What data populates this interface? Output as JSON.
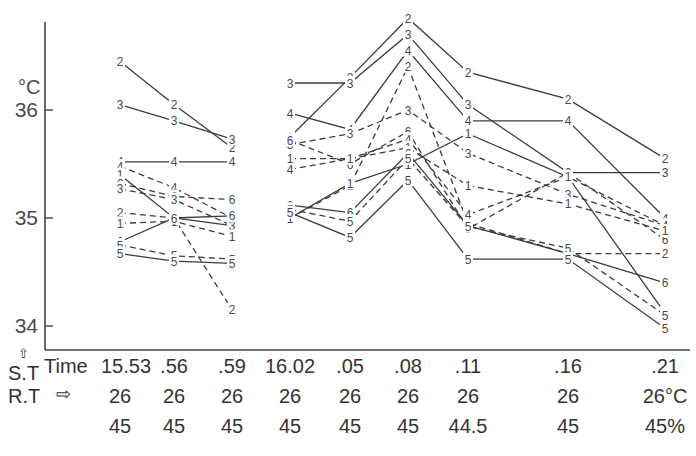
{
  "chart_data": {
    "type": "line",
    "title": "",
    "ylabel_unit": "°C",
    "ylim": [
      33.9,
      36.8
    ],
    "yticks": [
      34,
      35,
      36
    ],
    "x_labels": [
      "15.53",
      ".56",
      ".59",
      "16.02",
      ".05",
      ".08",
      ".11",
      ".16",
      ".21"
    ],
    "x_label_prefix": "Time",
    "row_labels": {
      "skin_temp": "S.T",
      "room_temp": "R.T",
      "arrow_up": "⇧",
      "arrow_right": "⇨"
    },
    "room_temp": [
      "26",
      "26",
      "26",
      "26",
      "26",
      "26",
      "26",
      "26",
      "26°C"
    ],
    "humidity": [
      "45",
      "45",
      "45",
      "45",
      "45",
      "45",
      "44.5",
      "45",
      "45%"
    ],
    "segments": [
      {
        "group": "A",
        "label": "2",
        "style": "solid",
        "points": [
          [
            0,
            36.45
          ],
          [
            1,
            36.05
          ],
          [
            2,
            35.65
          ]
        ]
      },
      {
        "group": "A",
        "label": "3",
        "style": "solid",
        "points": [
          [
            0,
            36.05
          ],
          [
            1,
            35.9
          ],
          [
            2,
            35.73
          ]
        ]
      },
      {
        "group": "A",
        "label": "4",
        "style": "solid",
        "points": [
          [
            0,
            35.52
          ],
          [
            1,
            35.52
          ],
          [
            2,
            35.52
          ]
        ]
      },
      {
        "group": "A",
        "label": "4",
        "style": "dashed",
        "points": [
          [
            0,
            35.48
          ],
          [
            1,
            35.28
          ],
          [
            2,
            35.0
          ]
        ]
      },
      {
        "group": "A",
        "label": "1",
        "style": "solid",
        "points": [
          [
            0,
            35.4
          ],
          [
            1,
            35.0
          ],
          [
            2,
            34.93
          ]
        ]
      },
      {
        "group": "A",
        "label": "6",
        "style": "dashed",
        "points": [
          [
            0,
            35.32
          ],
          [
            1,
            35.2
          ],
          [
            2,
            35.17
          ]
        ]
      },
      {
        "group": "A",
        "label": "3",
        "style": "dashed",
        "points": [
          [
            0,
            35.27
          ],
          [
            1,
            35.17
          ],
          [
            2,
            34.93
          ]
        ]
      },
      {
        "group": "A",
        "label": "2",
        "style": "dashed",
        "points": [
          [
            0,
            35.05
          ],
          [
            1,
            35.0
          ],
          [
            2,
            34.15
          ]
        ]
      },
      {
        "group": "A",
        "label": "1",
        "style": "dashed",
        "points": [
          [
            0,
            34.95
          ],
          [
            1,
            34.97
          ],
          [
            2,
            34.83
          ]
        ]
      },
      {
        "group": "A",
        "label": "6",
        "style": "solid",
        "points": [
          [
            0,
            34.78
          ],
          [
            1,
            35.0
          ],
          [
            2,
            35.02
          ]
        ]
      },
      {
        "group": "A",
        "label": "5",
        "style": "dashed",
        "points": [
          [
            0,
            34.75
          ],
          [
            1,
            34.65
          ],
          [
            2,
            34.62
          ]
        ]
      },
      {
        "group": "A",
        "label": "5",
        "style": "solid",
        "points": [
          [
            0,
            34.67
          ],
          [
            1,
            34.6
          ],
          [
            2,
            34.58
          ]
        ]
      },
      {
        "group": "B",
        "label": "2",
        "style": "solid",
        "points": [
          [
            3,
            35.75
          ],
          [
            4,
            36.3
          ],
          [
            5,
            36.85
          ],
          [
            6,
            36.35
          ],
          [
            7,
            36.1
          ],
          [
            8,
            35.55
          ]
        ]
      },
      {
        "group": "B",
        "label": "3",
        "style": "solid",
        "points": [
          [
            3,
            36.25
          ],
          [
            4,
            36.25
          ],
          [
            5,
            36.7
          ],
          [
            6,
            36.05
          ],
          [
            7,
            35.42
          ],
          [
            8,
            35.42
          ]
        ]
      },
      {
        "group": "B",
        "label": "4",
        "style": "solid",
        "points": [
          [
            3,
            35.97
          ],
          [
            4,
            35.82
          ],
          [
            5,
            36.55
          ],
          [
            6,
            35.9
          ],
          [
            7,
            35.9
          ],
          [
            8,
            35.0
          ]
        ]
      },
      {
        "group": "B",
        "label": "3",
        "style": "dashed",
        "points": [
          [
            3,
            35.68
          ],
          [
            4,
            35.78
          ],
          [
            5,
            36.0
          ],
          [
            6,
            35.6
          ],
          [
            7,
            35.22
          ],
          [
            8,
            34.93
          ]
        ]
      },
      {
        "group": "B",
        "label": "2",
        "style": "dashed",
        "points": [
          [
            3,
            35.0
          ],
          [
            4,
            35.3
          ],
          [
            5,
            36.4
          ],
          [
            6,
            34.95
          ],
          [
            7,
            34.67
          ],
          [
            8,
            34.67
          ]
        ]
      },
      {
        "group": "B",
        "label": "6",
        "style": "dashed",
        "points": [
          [
            3,
            35.72
          ],
          [
            4,
            35.5
          ],
          [
            5,
            35.8
          ],
          [
            6,
            34.9
          ],
          [
            7,
            35.42
          ],
          [
            8,
            34.8
          ]
        ]
      },
      {
        "group": "B",
        "label": "4",
        "style": "dashed",
        "points": [
          [
            3,
            35.45
          ],
          [
            4,
            35.55
          ],
          [
            5,
            35.73
          ],
          [
            6,
            35.03
          ],
          [
            7,
            35.38
          ],
          [
            8,
            34.93
          ]
        ]
      },
      {
        "group": "B",
        "label": "1",
        "style": "dashed",
        "points": [
          [
            3,
            35.55
          ],
          [
            4,
            35.55
          ],
          [
            5,
            35.65
          ],
          [
            6,
            35.3
          ],
          [
            7,
            35.13
          ],
          [
            8,
            34.88
          ]
        ]
      },
      {
        "group": "B",
        "label": "1",
        "style": "solid",
        "points": [
          [
            3,
            35.0
          ],
          [
            4,
            35.32
          ],
          [
            5,
            35.5
          ],
          [
            6,
            35.78
          ],
          [
            7,
            35.38
          ],
          [
            8,
            34.12
          ]
        ]
      },
      {
        "group": "B",
        "label": "6",
        "style": "solid",
        "points": [
          [
            3,
            35.12
          ],
          [
            4,
            35.05
          ],
          [
            5,
            35.6
          ],
          [
            6,
            34.93
          ],
          [
            7,
            34.67
          ],
          [
            8,
            34.4
          ]
        ]
      },
      {
        "group": "B",
        "label": "5",
        "style": "dashed",
        "points": [
          [
            3,
            35.08
          ],
          [
            4,
            34.97
          ],
          [
            5,
            35.55
          ],
          [
            6,
            34.92
          ],
          [
            7,
            34.72
          ],
          [
            8,
            34.1
          ]
        ]
      },
      {
        "group": "B",
        "label": "5",
        "style": "solid",
        "points": [
          [
            3,
            35.05
          ],
          [
            4,
            34.82
          ],
          [
            5,
            35.35
          ],
          [
            6,
            34.62
          ],
          [
            7,
            34.62
          ],
          [
            8,
            33.98
          ]
        ]
      }
    ]
  }
}
